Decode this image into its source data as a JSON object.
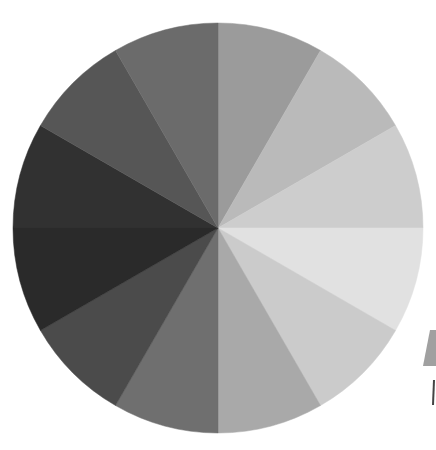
{
  "chart_data": {
    "type": "pie",
    "title": "",
    "center": [
      218,
      228
    ],
    "radius": 205,
    "start_angle_deg": 0,
    "direction": "clockwise",
    "categories": [
      "W1",
      "W2",
      "W3",
      "W4",
      "W5",
      "W6",
      "W7",
      "W8",
      "W9",
      "W10",
      "W11",
      "W12"
    ],
    "values": [
      1,
      1,
      1,
      1,
      1,
      1,
      1,
      1,
      1,
      1,
      1,
      1
    ],
    "colors": [
      "#9b9b9b",
      "#bababa",
      "#cdcdcd",
      "#e1e1e1",
      "#cbcbcb",
      "#a9a9a9",
      "#6f6f6f",
      "#4b4b4b",
      "#2a2a2a",
      "#313131",
      "#565656",
      "#6b6b6b"
    ],
    "legend": null
  },
  "artifact": {
    "color": "#a0a0a0",
    "line_color": "#444444"
  }
}
